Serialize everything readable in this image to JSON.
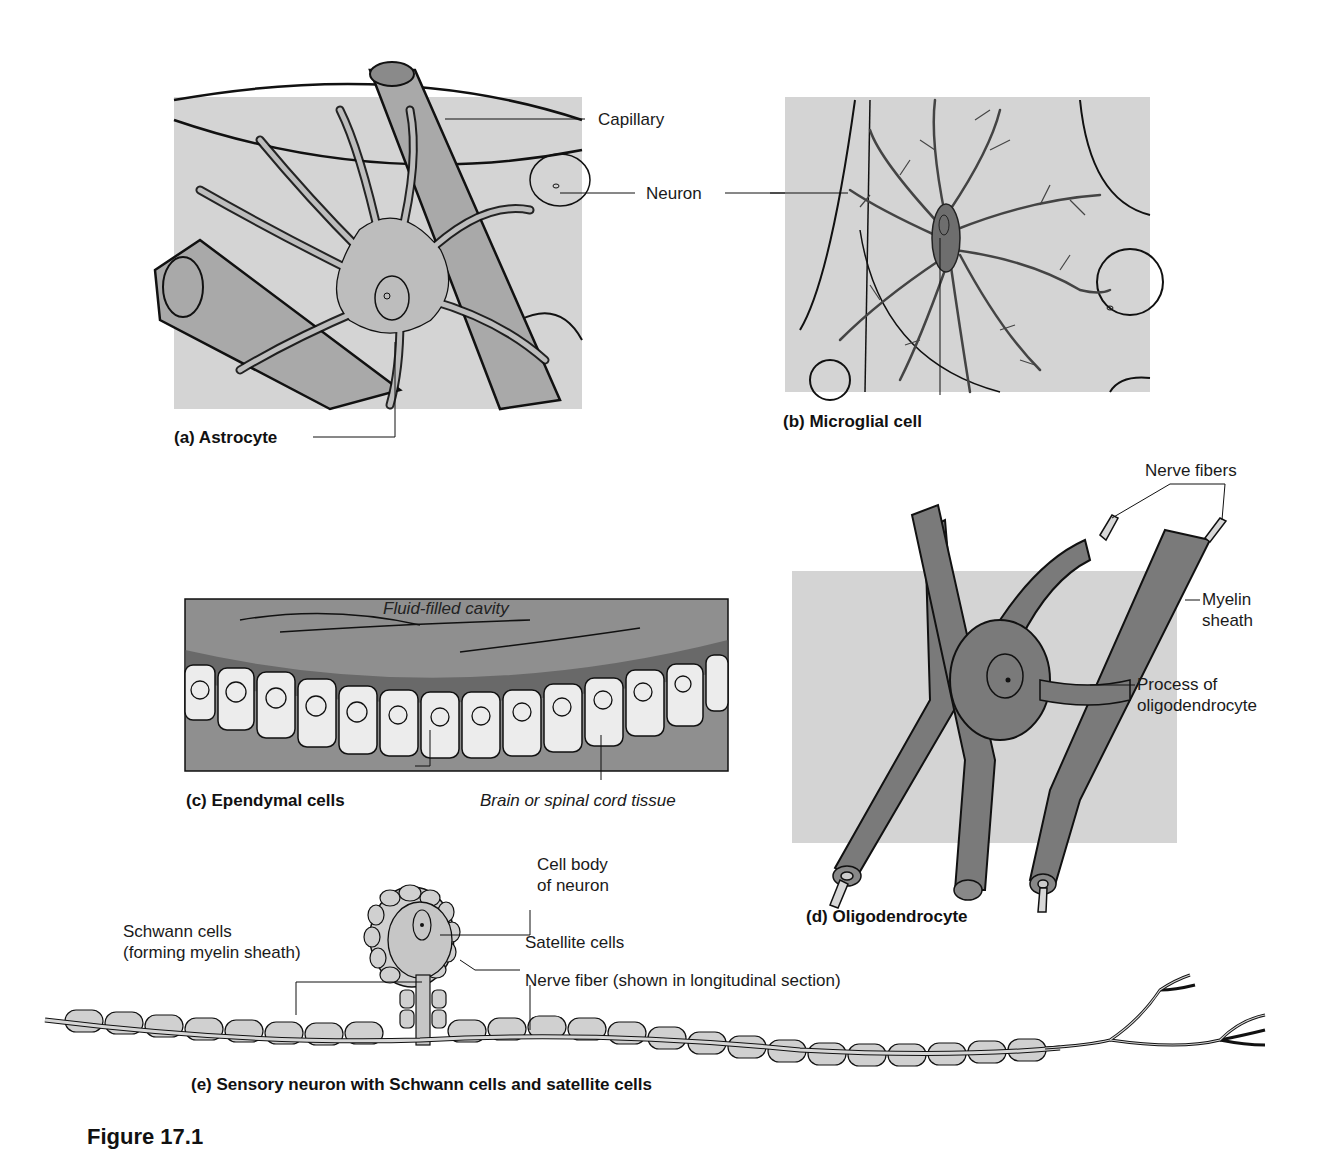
{
  "figure": {
    "number_label": "Figure 17.1",
    "colors": {
      "light_bg": "#d4d4d4",
      "mid_gray": "#a9a9a9",
      "dark_gray": "#6e6e6e",
      "ependymal_bg": "#8f8f8f",
      "cell_fill": "#ececec",
      "line": "#111111"
    }
  },
  "panels": {
    "a": {
      "caption": "(a) Astrocyte",
      "labels": {
        "capillary": "Capillary",
        "neuron": "Neuron"
      }
    },
    "b": {
      "caption": "(b) Microglial cell"
    },
    "c": {
      "caption": "(c) Ependymal cells",
      "labels": {
        "cavity": "Fluid-filled cavity",
        "tissue": "Brain or spinal cord tissue"
      }
    },
    "d": {
      "caption": "(d) Oligodendrocyte",
      "labels": {
        "nerve_fibers": "Nerve fibers",
        "myelin_line1": "Myelin",
        "myelin_line2": "sheath",
        "process_line1": "Process of",
        "process_line2": "oligodendrocyte"
      }
    },
    "e": {
      "caption": "(e) Sensory neuron with Schwann cells and satellite cells",
      "labels": {
        "cell_body_line1": "Cell body",
        "cell_body_line2": "of neuron",
        "satellite": "Satellite cells",
        "schwann_line1": "Schwann cells",
        "schwann_line2": "(forming myelin sheath)",
        "nerve_fiber": "Nerve fiber (shown in longitudinal section)"
      }
    }
  }
}
